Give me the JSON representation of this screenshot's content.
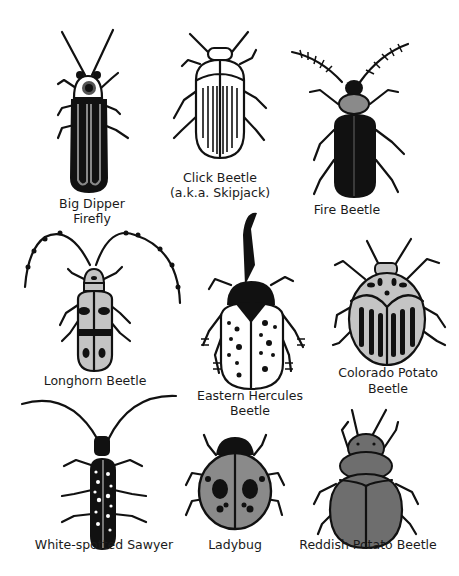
{
  "beetles": [
    {
      "name": "Big Dipper Firefly",
      "label_line1": "Big Dipper",
      "label_line2": "Firefly"
    },
    {
      "name": "Click Beetle",
      "label_line1": "Click Beetle",
      "label_line2": "(a.k.a. Skipjack)"
    },
    {
      "name": "Fire Beetle",
      "label_line1": "Fire Beetle"
    },
    {
      "name": "Longhorn Beetle",
      "label_line1": "Longhorn Beetle"
    },
    {
      "name": "Eastern Hercules Beetle",
      "label_line1": "Eastern Hercules",
      "label_line2": "Beetle"
    },
    {
      "name": "Colorado Potato Beetle",
      "label_line1": "Colorado Potato",
      "label_line2": "Beetle"
    },
    {
      "name": "White-spotted Sawyer",
      "label_line1": "White-spotted Sawyer"
    },
    {
      "name": "Ladybug",
      "label_line1": "Ladybug"
    },
    {
      "name": "Reddish Potato Beetle",
      "label_line1": "Reddish Potato Beetle"
    }
  ],
  "colors": {
    "ink": "#111111",
    "gray_light": "#c4c4c4",
    "gray_mid": "#8a8a8a",
    "gray_dark": "#6e6e6e",
    "background": "#ffffff"
  }
}
